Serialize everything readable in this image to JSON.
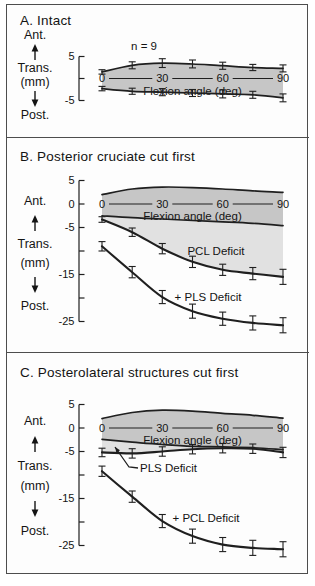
{
  "side_labels": {
    "ant": "Ant.",
    "trans": "Trans.",
    "mm": "(mm)",
    "post": "Post."
  },
  "colors": {
    "band_fill": "#c6c6c6",
    "deficit_fill": "#e1e1e1",
    "line": "#1f1f1f",
    "frame": "#4d4d4d"
  },
  "chart_data": [
    {
      "panel": "A",
      "type": "line",
      "title": "A. Intact",
      "annotation": "n = 9",
      "xlabel": "Flexion angle (deg)",
      "ylabel": "Trans. (mm)",
      "x": [
        0,
        15,
        30,
        45,
        60,
        75,
        90
      ],
      "x_ticks": [
        {
          "deg": 0,
          "label": "0"
        },
        {
          "deg": 30,
          "label": "30"
        },
        {
          "deg": 60,
          "label": "60"
        },
        {
          "deg": 90,
          "label": "90"
        }
      ],
      "y_ticks": [
        {
          "v": 5,
          "label": "5"
        },
        {
          "v": 0,
          "label": ""
        },
        {
          "v": -5,
          "label": "-5"
        }
      ],
      "ylim": [
        -5,
        5
      ],
      "series": [
        {
          "name": "intact anterior limit",
          "values": [
            1.5,
            3.0,
            3.5,
            3.3,
            2.9,
            2.5,
            2.3
          ],
          "errors": [
            0.5,
            0.8,
            1.0,
            0.9,
            0.8,
            0.7,
            0.8
          ]
        },
        {
          "name": "intact posterior limit",
          "values": [
            -2.3,
            -2.9,
            -3.1,
            -3.3,
            -3.5,
            -3.7,
            -4.4
          ],
          "errors": [
            0.5,
            0.7,
            0.8,
            0.8,
            0.9,
            0.8,
            0.9
          ]
        }
      ],
      "fills": [
        {
          "between": [
            0,
            1
          ],
          "color_key": "band_fill"
        }
      ]
    },
    {
      "panel": "B",
      "type": "line",
      "title": "B. Posterior cruciate cut first",
      "xlabel": "Flexion angle (deg)",
      "ylabel": "Trans. (mm)",
      "x": [
        0,
        15,
        30,
        45,
        60,
        75,
        90
      ],
      "x_ticks": [
        {
          "deg": 0,
          "label": "0"
        },
        {
          "deg": 30,
          "label": "30"
        },
        {
          "deg": 60,
          "label": "60"
        },
        {
          "deg": 90,
          "label": "90"
        }
      ],
      "y_ticks": [
        {
          "v": 5,
          "label": "5"
        },
        {
          "v": 0,
          "label": "0"
        },
        {
          "v": -5,
          "label": "-5"
        },
        {
          "v": -10,
          "label": ""
        },
        {
          "v": -15,
          "label": "-15"
        },
        {
          "v": -20,
          "label": ""
        },
        {
          "v": -25,
          "label": "-25"
        }
      ],
      "ylim": [
        -27,
        5
      ],
      "series": [
        {
          "name": "intact anterior limit",
          "values": [
            2.0,
            3.2,
            3.6,
            3.5,
            3.2,
            2.8,
            2.5
          ]
        },
        {
          "name": "intact posterior limit",
          "values": [
            -2.5,
            -2.9,
            -3.2,
            -3.5,
            -3.8,
            -4.1,
            -4.6
          ]
        },
        {
          "name": "PCL Deficit",
          "label": "PCL Deficit",
          "values": [
            -3.3,
            -6.0,
            -9.5,
            -12.3,
            -14.0,
            -14.8,
            -15.5
          ],
          "errors": [
            0.6,
            0.9,
            1.1,
            1.2,
            1.2,
            1.3,
            1.6
          ]
        },
        {
          "name": "+ PLS Deficit",
          "label": "+ PLS Deficit",
          "values": [
            -9.0,
            -14.5,
            -19.8,
            -22.8,
            -24.4,
            -25.3,
            -25.8
          ],
          "errors": [
            1.0,
            1.2,
            1.4,
            1.5,
            1.4,
            1.5,
            1.6
          ]
        }
      ],
      "fills": [
        {
          "between": [
            0,
            1
          ],
          "color_key": "band_fill"
        },
        {
          "between": [
            1,
            2
          ],
          "color_key": "deficit_fill"
        }
      ]
    },
    {
      "panel": "C",
      "type": "line",
      "title": "C. Posterolateral structures cut first",
      "xlabel": "Flexion angle (deg)",
      "ylabel": "Trans. (mm)",
      "x": [
        0,
        15,
        30,
        45,
        60,
        75,
        90
      ],
      "x_ticks": [
        {
          "deg": 0,
          "label": "0"
        },
        {
          "deg": 30,
          "label": "30"
        },
        {
          "deg": 60,
          "label": "60"
        },
        {
          "deg": 90,
          "label": "90"
        }
      ],
      "y_ticks": [
        {
          "v": 5,
          "label": "5"
        },
        {
          "v": 0,
          "label": "0"
        },
        {
          "v": -5,
          "label": "-5"
        },
        {
          "v": -10,
          "label": ""
        },
        {
          "v": -15,
          "label": "-15"
        },
        {
          "v": -20,
          "label": ""
        },
        {
          "v": -25,
          "label": "-25"
        }
      ],
      "ylim": [
        -27,
        5
      ],
      "series": [
        {
          "name": "intact anterior limit",
          "values": [
            2.0,
            3.3,
            3.8,
            3.6,
            3.1,
            2.7,
            2.1
          ]
        },
        {
          "name": "intact posterior limit",
          "values": [
            -2.4,
            -3.0,
            -3.5,
            -3.9,
            -4.0,
            -4.2,
            -4.6
          ]
        },
        {
          "name": "PLS Deficit",
          "label": "PLS Deficit",
          "values": [
            -5.2,
            -5.4,
            -5.0,
            -4.5,
            -4.3,
            -4.4,
            -5.2
          ],
          "errors": [
            0.9,
            1.0,
            1.0,
            1.0,
            1.0,
            1.0,
            1.1
          ]
        },
        {
          "name": "+ PCL Deficit",
          "label": "+ PCL Deficit",
          "values": [
            -9.2,
            -14.6,
            -19.8,
            -23.0,
            -24.8,
            -25.5,
            -25.8
          ],
          "errors": [
            1.1,
            1.2,
            1.4,
            1.5,
            1.5,
            1.6,
            1.6
          ]
        }
      ],
      "fills": [
        {
          "between": [
            0,
            1
          ],
          "color_key": "band_fill"
        },
        {
          "between": [
            1,
            2
          ],
          "color_key": "deficit_fill"
        }
      ]
    }
  ]
}
